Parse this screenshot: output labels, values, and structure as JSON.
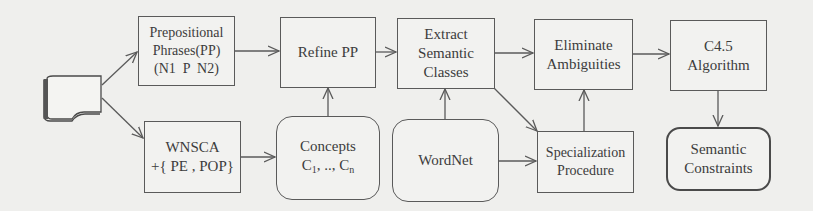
{
  "diagram": {
    "type": "flowchart",
    "nodes": {
      "source": {
        "icon": "document-icon"
      },
      "pp": {
        "lines": [
          "Prepositional",
          "Phrases(PP)",
          "(N1  P  N2)"
        ]
      },
      "refine": {
        "lines": [
          "Refine PP"
        ]
      },
      "extract": {
        "lines": [
          "Extract",
          "Semantic",
          "Classes"
        ]
      },
      "eliminate": {
        "lines": [
          "Eliminate",
          "Ambiguities"
        ]
      },
      "c45": {
        "lines": [
          "C4.5",
          "Algorithm"
        ]
      },
      "wnsca": {
        "lines": [
          "WNSCA",
          "+{ PE , POP}"
        ]
      },
      "concepts": {
        "line1": "Concepts",
        "c": "C",
        "sub1": "1",
        "mid": ", .., ",
        "c2": "C",
        "subn": "n"
      },
      "wordnet": {
        "lines": [
          "WordNet"
        ]
      },
      "special": {
        "lines": [
          "Specialization",
          "Procedure"
        ]
      },
      "constraints": {
        "lines": [
          "Semantic",
          "Constraints"
        ]
      }
    },
    "edges": [
      {
        "from": "source",
        "to": "pp"
      },
      {
        "from": "source",
        "to": "wnsca"
      },
      {
        "from": "pp",
        "to": "refine"
      },
      {
        "from": "refine",
        "to": "extract"
      },
      {
        "from": "extract",
        "to": "eliminate"
      },
      {
        "from": "eliminate",
        "to": "c45"
      },
      {
        "from": "c45",
        "to": "constraints"
      },
      {
        "from": "wnsca",
        "to": "concepts"
      },
      {
        "from": "concepts",
        "to": "refine"
      },
      {
        "from": "wordnet",
        "to": "extract"
      },
      {
        "from": "wordnet",
        "to": "special"
      },
      {
        "from": "extract",
        "to": "special"
      },
      {
        "from": "special",
        "to": "eliminate"
      }
    ],
    "colors": {
      "stroke": "#5a5a5a",
      "background": "#efefed",
      "text": "#3c3c3c"
    }
  }
}
